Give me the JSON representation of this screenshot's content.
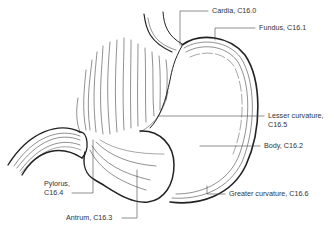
{
  "diagram": {
    "labels": [
      {
        "id": "cardia",
        "text": "Cardia, C16.0"
      },
      {
        "id": "fundus",
        "text": "Fundus, C16.1"
      },
      {
        "id": "lesser_curvature_1",
        "text": "Lesser curvature,"
      },
      {
        "id": "lesser_curvature_2",
        "text": "C16.5"
      },
      {
        "id": "body",
        "text": "Body, C16.2"
      },
      {
        "id": "greater_curvature",
        "text": "Greater curvature, C16.6"
      },
      {
        "id": "pylorus_1",
        "text": "Pylorus,"
      },
      {
        "id": "pylorus_2",
        "text": "C16.4"
      },
      {
        "id": "antrum",
        "text": "Antrum, C16.3"
      }
    ]
  }
}
